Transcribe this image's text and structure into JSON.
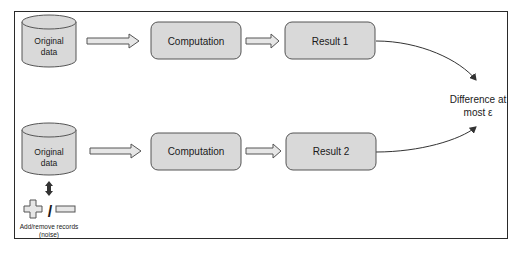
{
  "diagram": {
    "rows": [
      {
        "database": {
          "line1": "Original",
          "line2": "data"
        },
        "computation": "Computation",
        "result": "Result 1"
      },
      {
        "database": {
          "line1": "Original",
          "line2": "data"
        },
        "computation": "Computation",
        "result": "Result 2"
      }
    ],
    "difference": {
      "line1": "Difference at",
      "line2": "most ε"
    },
    "noise": {
      "line1": "Add/remove records",
      "line2": "(noise)",
      "separator": "/"
    },
    "colors": {
      "box_fill": "#d9d9d9",
      "box_stroke": "#555555",
      "arrow_fill": "#e6e6e6",
      "line": "#333333"
    }
  }
}
